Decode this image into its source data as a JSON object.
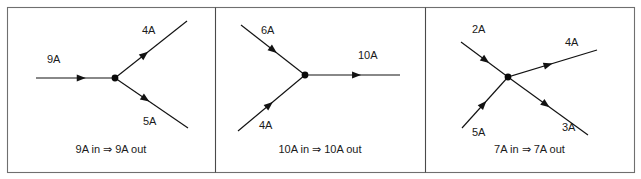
{
  "figure": {
    "width": 641,
    "height": 179,
    "background_color": "#ffffff",
    "line_color": "#121212",
    "frame_color": "#6f6f6f",
    "panel_count": 3
  },
  "panels": [
    {
      "id": "panel-1",
      "caption": "9A in ⇒ 9A out",
      "junction": {
        "x": 115,
        "y": 78
      },
      "branches": [
        {
          "name": "incoming-left-9a",
          "label": "9A",
          "direction": "in",
          "label_x": 47,
          "label_y": 60,
          "x1": 36,
          "y1": 78,
          "x2": 115,
          "y2": 78,
          "arrow_t": 0.63,
          "arrow_angle": 0
        },
        {
          "name": "outgoing-upper-right-4a",
          "label": "4A",
          "direction": "out",
          "label_x": 142,
          "label_y": 31,
          "x1": 115,
          "y1": 78,
          "x2": 187,
          "y2": 21,
          "arrow_t": 0.46,
          "arrow_angle": -38.4
        },
        {
          "name": "outgoing-lower-right-5a",
          "label": "5A",
          "direction": "out",
          "label_x": 143,
          "label_y": 122,
          "x1": 115,
          "y1": 78,
          "x2": 188,
          "y2": 128,
          "arrow_t": 0.47,
          "arrow_angle": 34.4
        }
      ]
    },
    {
      "id": "panel-2",
      "caption": "10A in ⇒ 10A out",
      "junction": {
        "x": 305,
        "y": 75
      },
      "branches": [
        {
          "name": "incoming-upper-left-6a",
          "label": "6A",
          "direction": "in",
          "label_x": 261,
          "label_y": 31,
          "x1": 241,
          "y1": 25,
          "x2": 305,
          "y2": 75,
          "arrow_t": 0.56,
          "arrow_angle": 38.0
        },
        {
          "name": "incoming-lower-left-4a",
          "label": "4A",
          "direction": "in",
          "label_x": 259,
          "label_y": 126,
          "x1": 238,
          "y1": 131,
          "x2": 305,
          "y2": 75,
          "arrow_t": 0.52,
          "arrow_angle": -39.9
        },
        {
          "name": "outgoing-right-10a",
          "label": "10A",
          "direction": "out",
          "label_x": 358,
          "label_y": 56,
          "x1": 305,
          "y1": 75,
          "x2": 400,
          "y2": 75,
          "arrow_t": 0.59,
          "arrow_angle": 0
        }
      ]
    },
    {
      "id": "panel-3",
      "caption": "7A in ⇒ 7A out",
      "junction": {
        "x": 508,
        "y": 77
      },
      "branches": [
        {
          "name": "incoming-upper-left-2a",
          "label": "2A",
          "direction": "in",
          "label_x": 472,
          "label_y": 30,
          "x1": 461,
          "y1": 42,
          "x2": 508,
          "y2": 77,
          "arrow_t": 0.6,
          "arrow_angle": 36.7
        },
        {
          "name": "incoming-lower-left-5a",
          "label": "5A",
          "direction": "in",
          "label_x": 472,
          "label_y": 133,
          "x1": 462,
          "y1": 128,
          "x2": 508,
          "y2": 77,
          "arrow_t": 0.53,
          "arrow_angle": -47.9
        },
        {
          "name": "outgoing-upper-right-4a",
          "label": "4A",
          "direction": "out",
          "label_x": 565,
          "label_y": 43,
          "x1": 508,
          "y1": 77,
          "x2": 597,
          "y2": 50,
          "arrow_t": 0.5,
          "arrow_angle": -16.9
        },
        {
          "name": "outgoing-lower-right-3a",
          "label": "3A",
          "direction": "out",
          "label_x": 562,
          "label_y": 128,
          "x1": 508,
          "y1": 77,
          "x2": 588,
          "y2": 135,
          "arrow_t": 0.52,
          "arrow_angle": 35.9
        }
      ]
    }
  ],
  "frame": {
    "x": 7,
    "y": 7,
    "width": 627,
    "height": 165,
    "dividers": [
      215,
      425
    ]
  },
  "caption_y": 150
}
